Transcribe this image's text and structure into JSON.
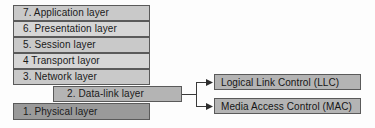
{
  "diagram": {
    "colors": {
      "background": "#fdfdfd",
      "border": "#5a5a5a",
      "layer_light": "#d6d6d6",
      "layer_medium": "#c9c9c9",
      "layer_datalink": "#b4b4b4",
      "layer_physical": "#9a9a9a",
      "text": "#1a1a1a"
    },
    "stack": {
      "name": "osi-layer-stack",
      "layers": [
        {
          "number": "7",
          "label": "7. Application layer"
        },
        {
          "number": "6",
          "label": "6. Presentation layer"
        },
        {
          "number": "5",
          "label": "5. Session layer"
        },
        {
          "number": "4",
          "label": "4  Transport layor"
        },
        {
          "number": "3",
          "label": "3. Network layer"
        },
        {
          "number": "2",
          "label": "2. Data-link layer"
        },
        {
          "number": "1",
          "label": "1. Physical layer"
        }
      ]
    },
    "sublayers": {
      "name": "data-link-sublayers",
      "items": [
        {
          "label": "Logical Link Control (LLC)"
        },
        {
          "label": "Media Access Control (MAC)"
        }
      ]
    }
  }
}
